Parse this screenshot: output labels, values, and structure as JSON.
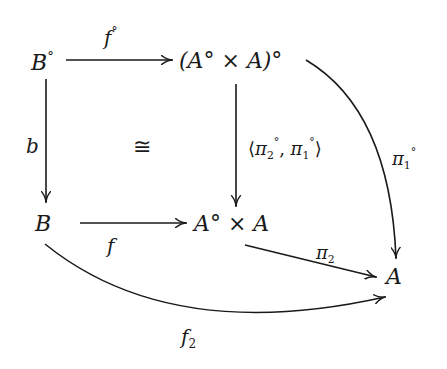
{
  "diagram": {
    "type": "commutative-diagram",
    "objects": {
      "b_op": {
        "base": "B",
        "sup": "°"
      },
      "prod_op": {
        "text": "(A° × A)°"
      },
      "b": {
        "base": "B"
      },
      "prod": {
        "text": "A° × A"
      },
      "a": {
        "base": "A"
      }
    },
    "morphisms": {
      "f_op": {
        "base": "f",
        "sup": "°",
        "from": "B°",
        "to": "(A° × A)°"
      },
      "b_map": {
        "base": "b",
        "from": "B°",
        "to": "B"
      },
      "pair": {
        "text_open": "⟨",
        "pi": "π",
        "sub2": "2",
        "sup": "°",
        "comma": ", ",
        "sub1": "1",
        "text_close": "⟩",
        "from": "(A° × A)°",
        "to": "A° × A"
      },
      "f": {
        "base": "f",
        "from": "B",
        "to": "A° × A"
      },
      "pi1_op": {
        "pi": "π",
        "sub": "1",
        "sup": "°",
        "from": "(A° × A)°",
        "to": "A"
      },
      "pi2": {
        "pi": "π",
        "sub": "2",
        "from": "A° × A",
        "to": "A"
      },
      "f2": {
        "base": "f",
        "sub": "2",
        "from": "B",
        "to": "A"
      }
    },
    "annotation": {
      "iso": "≅"
    }
  }
}
